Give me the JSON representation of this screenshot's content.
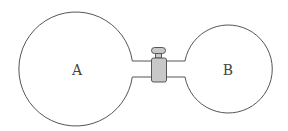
{
  "diagram": {
    "vessels": [
      {
        "id": "A",
        "label": "A",
        "cx": 77,
        "cy": 70,
        "r": 57
      },
      {
        "id": "B",
        "label": "B",
        "cx": 228,
        "cy": 70,
        "r": 44
      }
    ],
    "connector": {
      "type": "pipe-with-valve",
      "pipe_top_y": 61,
      "pipe_bottom_y": 77,
      "valve_fill": "#c8c8c8"
    },
    "colors": {
      "stroke": "#555555",
      "background": "#ffffff"
    }
  }
}
